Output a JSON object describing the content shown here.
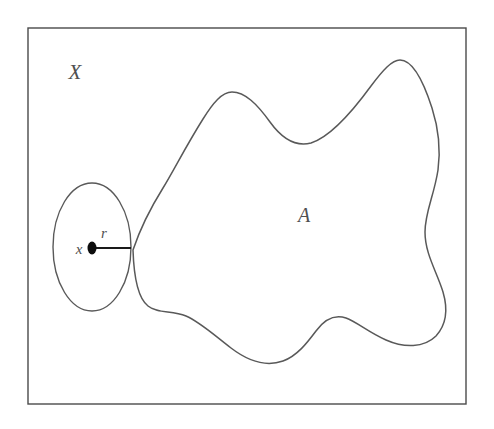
{
  "figure": {
    "kind": "point-set-topology-diagram",
    "background_color": "#ffffff",
    "stroke_color": "#595959",
    "frame_color": "#4a4a4a",
    "dot_color": "#0d0d0d",
    "width": 494,
    "height": 429
  },
  "labels": {
    "space": "X",
    "subset": "A",
    "point": "x",
    "radius": "r"
  },
  "geometry": {
    "frame": {
      "x": 28,
      "y": 28,
      "width": 438,
      "height": 376
    },
    "ball": {
      "cx": 92,
      "cy": 247,
      "rx": 39,
      "ry": 64
    },
    "center_dot": {
      "cx": 92,
      "cy": 248,
      "rx": 4.5,
      "ry": 6.5
    },
    "radius_segment": {
      "x1": 95,
      "y1": 248,
      "x2": 131,
      "y2": 248
    },
    "label_positions": {
      "space": {
        "x": 75,
        "y": 79
      },
      "subset": {
        "x": 304,
        "y": 222
      },
      "point": {
        "x": 79,
        "y": 254
      },
      "radius": {
        "x": 104,
        "y": 238
      }
    }
  }
}
